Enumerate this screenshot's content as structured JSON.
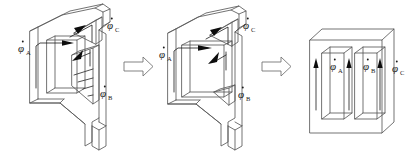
{
  "figure": {
    "background_color": "#ffffff",
    "line_color": "#5a5a5a",
    "flux_color": "#1a1a1a",
    "width": 410,
    "height": 156,
    "panels": [
      {
        "id": "panel-1",
        "name": "skewed-three-limb-core",
        "labels": [
          {
            "id": "a",
            "symbol": "φ",
            "subscript": "A",
            "dot": true,
            "x": 18,
            "y": 52
          },
          {
            "id": "c",
            "symbol": "φ",
            "subscript": "C",
            "dot": true,
            "x": 107,
            "y": 29
          },
          {
            "id": "b",
            "symbol": "φ",
            "subscript": "B",
            "dot": true,
            "x": 100,
            "y": 97
          }
        ]
      },
      {
        "id": "panel-2",
        "name": "partially-unfolded-core",
        "labels": [
          {
            "id": "a",
            "symbol": "φ",
            "subscript": "A",
            "dot": true,
            "x": 159,
            "y": 58
          },
          {
            "id": "c",
            "symbol": "φ",
            "subscript": "C",
            "dot": true,
            "x": 243,
            "y": 29
          },
          {
            "id": "b",
            "symbol": "φ",
            "subscript": "B",
            "dot": true,
            "x": 238,
            "y": 98
          }
        ]
      },
      {
        "id": "panel-3",
        "name": "planar-e-core",
        "labels": [
          {
            "id": "a",
            "symbol": "φ",
            "subscript": "A",
            "dot": true,
            "x": 330,
            "y": 70
          },
          {
            "id": "b",
            "symbol": "φ",
            "subscript": "B",
            "dot": true,
            "x": 363,
            "y": 70
          },
          {
            "id": "c",
            "symbol": "φ",
            "subscript": "C",
            "dot": true,
            "x": 392,
            "y": 72
          }
        ]
      }
    ],
    "transform_arrows": [
      {
        "id": "arrow-1",
        "name": "transform-arrow-1",
        "x": 124,
        "y": 64
      },
      {
        "id": "arrow-2",
        "name": "transform-arrow-2",
        "x": 262,
        "y": 64
      }
    ]
  }
}
